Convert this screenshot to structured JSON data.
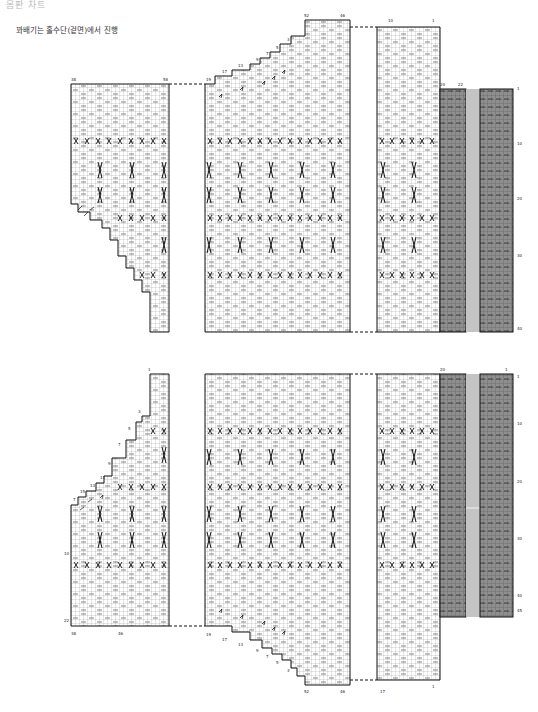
{
  "header": {
    "title": "몸판 차트",
    "note": "꽈배기는 홀수단(겉면)에서 진행"
  },
  "legend_colors": {
    "grid_line": "#9a9a9a",
    "outline": "#111111",
    "ribbing_fill": "#8f8f8f",
    "gap_fill": "#c4c4c4"
  },
  "top_chart": {
    "name": "back/front upper chart",
    "left_piece": {
      "labels": [
        "38",
        "58",
        "13",
        "15",
        "11",
        "9",
        "7",
        "5",
        "3",
        "1"
      ]
    },
    "middle_piece": {
      "labels": [
        "19",
        "17",
        "13",
        "9",
        "7",
        "5",
        "3",
        "1",
        "52",
        "46"
      ]
    },
    "right_piece": {
      "labels": [
        "10",
        "1"
      ]
    },
    "ribbing": {
      "labels": [
        "20",
        "22",
        "1",
        "10",
        "20",
        "30",
        "40"
      ]
    }
  },
  "bottom_chart": {
    "name": "back/front lower chart",
    "left_piece": {
      "labels": [
        "1",
        "7",
        "15",
        "13",
        "11",
        "9",
        "7",
        "5",
        "3",
        "10",
        "22",
        "46"
      ]
    },
    "middle_piece": {
      "labels": [
        "52",
        "46",
        "19",
        "17",
        "13",
        "9",
        "7",
        "5",
        "3",
        "1"
      ]
    },
    "right_piece": {
      "labels": [
        "10",
        "1"
      ]
    },
    "ribbing": {
      "labels": [
        "20",
        "1",
        "10",
        "20",
        "30",
        "40",
        "45"
      ]
    }
  }
}
